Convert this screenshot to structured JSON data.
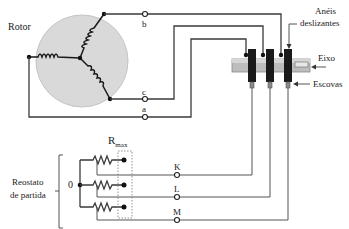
{
  "diagram": {
    "type": "wound-rotor induction motor with starting rheostat",
    "labels": {
      "rotor": "Rotor",
      "slip_rings_line1": "Anéis",
      "slip_rings_line2": "deslizantes",
      "shaft": "Eixo",
      "brushes": "Escovas",
      "rheostat_line1": "Reostato",
      "rheostat_line2": "de partida",
      "neutral": "0",
      "rmax_main": "R",
      "rmax_sub": "max"
    },
    "rotor_terminals": [
      {
        "id": "b",
        "label": "b"
      },
      {
        "id": "c",
        "label": "c"
      },
      {
        "id": "a",
        "label": "a"
      }
    ],
    "rheostat_terminals": [
      {
        "id": "K",
        "label": "K"
      },
      {
        "id": "L",
        "label": "L"
      },
      {
        "id": "M",
        "label": "M"
      }
    ],
    "colors": {
      "rotor_fill": "#d9d9d9",
      "ring": "#1a1a1a",
      "shaft_fill": "#bdbdbd",
      "wire": "#3a3a3a"
    }
  }
}
